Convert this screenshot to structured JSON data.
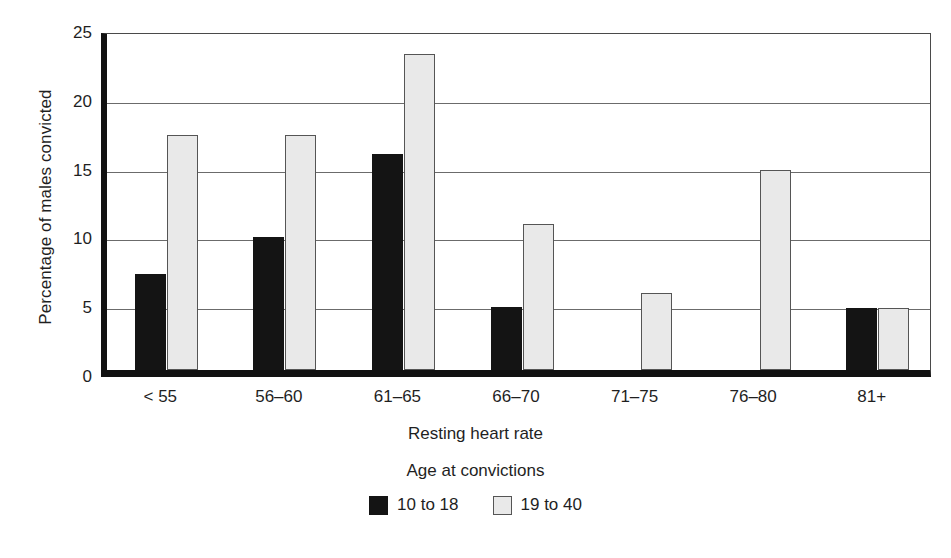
{
  "chart_data": {
    "type": "bar",
    "title": "",
    "xlabel": "Resting heart rate",
    "ylabel": "Percentage of males convicted",
    "categories": [
      "< 55",
      "56–60",
      "61–65",
      "66–70",
      "71–75",
      "76–80",
      "81+"
    ],
    "series": [
      {
        "name": "10 to 18",
        "color": "#141414",
        "values": [
          7.0,
          9.7,
          15.7,
          4.6,
          0,
          0,
          4.5
        ]
      },
      {
        "name": "19 to 40",
        "color": "#e9e9e9",
        "values": [
          17.1,
          17.1,
          23.0,
          10.6,
          5.6,
          14.5,
          4.5
        ]
      }
    ],
    "ylim": [
      0,
      25
    ],
    "yticks": [
      0,
      5,
      10,
      15,
      20,
      25
    ],
    "ytick_labels": [
      "0",
      "5",
      "10",
      "15",
      "20",
      "25"
    ],
    "grid": true,
    "legend_title": "Age at convictions",
    "legend_position": "bottom"
  },
  "axes": {
    "y_title": "Percentage of males convicted",
    "x_title": "Resting heart rate"
  },
  "legend": {
    "title": "Age at convictions",
    "items": [
      {
        "label": "10 to 18",
        "swatch": "dark"
      },
      {
        "label": "19 to 40",
        "swatch": "light"
      }
    ]
  },
  "style": {
    "dark_bar_color": "#141414",
    "light_bar_color": "#e9e9e9",
    "bar_border_color": "#555555",
    "axis_color": "#111111",
    "grid_color": "#6b6b6b",
    "background": "#ffffff"
  }
}
